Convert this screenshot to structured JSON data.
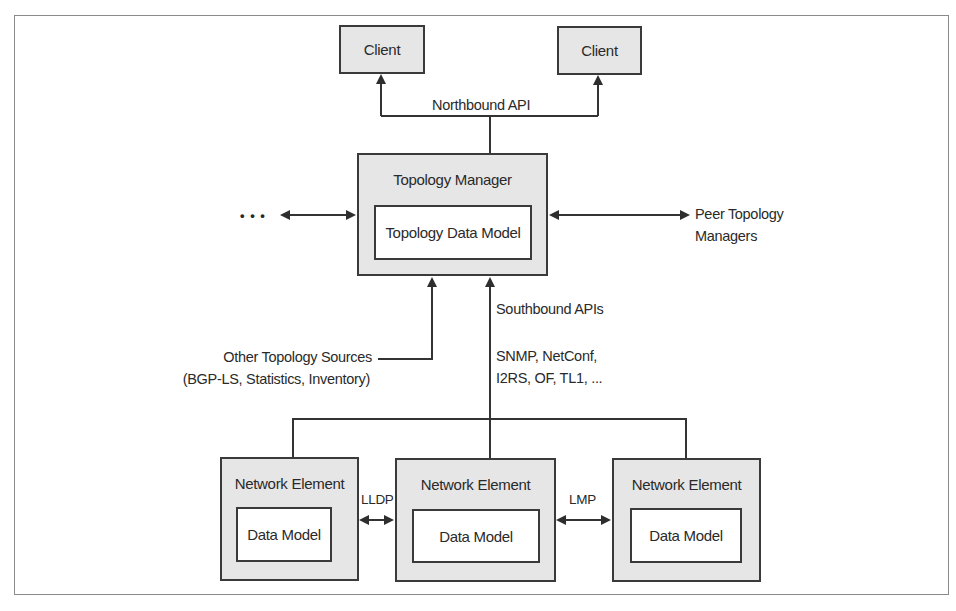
{
  "diagram": {
    "clients": [
      {
        "label": "Client"
      },
      {
        "label": "Client"
      }
    ],
    "northbound_label": "Northbound API",
    "topology_manager": {
      "title": "Topology Manager",
      "data_model": "Topology Data Model"
    },
    "ellipsis": "• • •",
    "peer": {
      "line1": "Peer Topology",
      "line2": "Managers"
    },
    "southbound_label": "Southbound APIs",
    "protocols": {
      "line1": "SNMP, NetConf,",
      "line2": "I2RS, OF, TL1, ..."
    },
    "other_sources": {
      "line1": "Other Topology Sources",
      "line2": "(BGP-LS, Statistics, Inventory)"
    },
    "network_elements": [
      {
        "title": "Network Element",
        "data_model": "Data Model"
      },
      {
        "title": "Network Element",
        "data_model": "Data Model"
      },
      {
        "title": "Network Element",
        "data_model": "Data Model"
      }
    ],
    "links": [
      {
        "label": "LLDP"
      },
      {
        "label": "LMP"
      }
    ],
    "colors": {
      "box_fill": "#e6e6e6",
      "stroke": "#3a3a3a",
      "frame": "#8a8a8a"
    }
  }
}
